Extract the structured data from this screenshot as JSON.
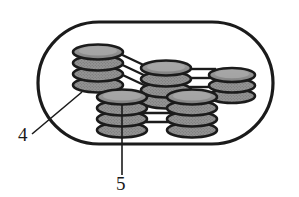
{
  "figure": {
    "type": "technical-line-drawing",
    "background_color": "#ffffff",
    "stroke_color": "#1b1b1b",
    "disc_fill_color": "#8f8f8f",
    "disc_highlight_color": "#9d9d9d",
    "enclosure": {
      "name": "housing-outline",
      "shape": "stadium",
      "x": 38,
      "y": 22,
      "width": 235,
      "height": 122,
      "corner_radius": 61,
      "stroke_width": 3.2
    },
    "stacks": [
      {
        "id": "stack-upper-left",
        "label": "upper left disc stack",
        "cx": 98,
        "cy": 52,
        "disc_count": 4,
        "rx": 25,
        "ry": 7.5,
        "spacing": 11
      },
      {
        "id": "stack-upper-middle",
        "label": "upper middle disc stack",
        "cx": 166,
        "cy": 68,
        "disc_count": 4,
        "rx": 25,
        "ry": 7.5,
        "spacing": 11
      },
      {
        "id": "stack-upper-right",
        "label": "upper right disc stack",
        "cx": 232,
        "cy": 75,
        "disc_count": 3,
        "rx": 23,
        "ry": 7,
        "spacing": 10.5
      },
      {
        "id": "stack-lower-left",
        "label": "lower left disc stack",
        "cx": 122,
        "cy": 108,
        "disc_count": 4,
        "rx": 25,
        "ry": 7.5,
        "spacing": 11
      },
      {
        "id": "stack-lower-right",
        "label": "lower right disc stack",
        "cx": 192,
        "cy": 108,
        "disc_count": 4,
        "rx": 25,
        "ry": 7.5,
        "spacing": 11
      }
    ],
    "connectors": [
      {
        "id": "connector-upper-left-to-middle",
        "from": "stack-upper-left",
        "to": "stack-upper-middle",
        "line_count": 3,
        "orientation": "diagonal"
      },
      {
        "id": "connector-upper-middle-to-right",
        "from": "stack-upper-middle",
        "to": "stack-upper-right",
        "line_count": 3,
        "orientation": "horizontal"
      },
      {
        "id": "connector-lower-left-to-right",
        "from": "stack-lower-left",
        "to": "stack-lower-right",
        "line_count": 3,
        "orientation": "horizontal"
      }
    ],
    "reference_labels": [
      {
        "id": "ref-4",
        "text": "4",
        "text_x": 18,
        "text_y": 141,
        "leader": {
          "x1": 32,
          "y1": 134,
          "x2": 82,
          "y2": 92
        },
        "points_to": "housing-outline"
      },
      {
        "id": "ref-5",
        "text": "5",
        "text_x": 116,
        "text_y": 188,
        "leader": {
          "x1": 122,
          "y1": 175,
          "x2": 122,
          "y2": 107
        },
        "points_to": "stack-lower-left"
      }
    ]
  }
}
